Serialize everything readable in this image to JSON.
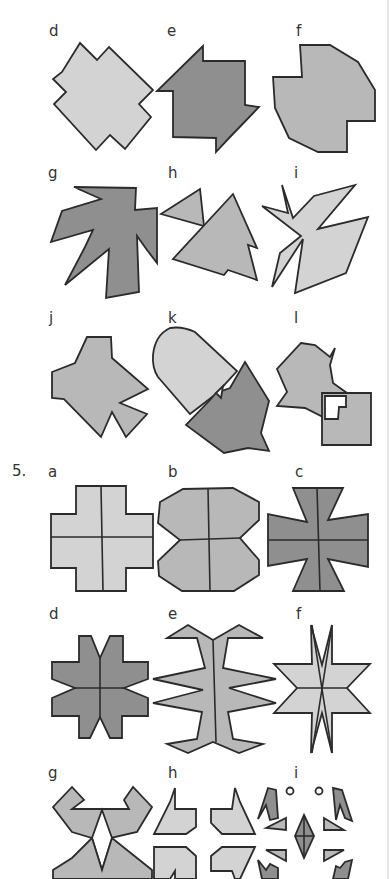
{
  "section_prev": {
    "rows": [
      {
        "labels": [
          "d",
          "e",
          "f"
        ]
      },
      {
        "labels": [
          "g",
          "h",
          "i"
        ]
      },
      {
        "labels": [
          "j",
          "k",
          "l"
        ]
      }
    ]
  },
  "question5": {
    "number": "5.",
    "rows": [
      {
        "labels": [
          "a",
          "b",
          "c"
        ]
      },
      {
        "labels": [
          "d",
          "e",
          "f"
        ]
      },
      {
        "labels": [
          "g",
          "h",
          "i"
        ]
      }
    ]
  },
  "colors": {
    "light_fill": "#d3d3d3",
    "mid_fill": "#b8b8b8",
    "dark_fill": "#8f8f8f",
    "outline": "#2b2b2b"
  }
}
